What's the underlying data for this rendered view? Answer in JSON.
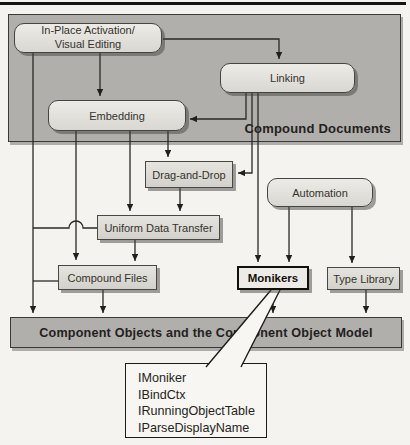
{
  "figure": {
    "regions": {
      "compound_documents": {
        "label": "Compound Documents"
      },
      "com_bar": {
        "label": "Component Objects and the Component Object Model"
      }
    },
    "boxes": {
      "in_place": {
        "line1": "In-Place Activation/",
        "line2": "Visual Editing"
      },
      "linking": {
        "label": "Linking"
      },
      "embedding": {
        "label": "Embedding"
      },
      "drag_and_drop": {
        "label": "Drag-and-Drop"
      },
      "automation": {
        "label": "Automation"
      },
      "uniform_data_transfer": {
        "label": "Uniform Data Transfer"
      },
      "compound_files": {
        "label": "Compound Files"
      },
      "monikers": {
        "label": "Monikers"
      },
      "type_library": {
        "label": "Type Library"
      }
    },
    "callout": {
      "interfaces": [
        "IMoniker",
        "IBindCtx",
        "IRunningObjectTable",
        "IParseDisplayName"
      ]
    },
    "colors": {
      "region_fill": "#b1afab",
      "box_fill_light": "#edebe6",
      "box_border": "#47443f",
      "line": "#2b2927",
      "paper": "#f4f3f0",
      "callout_fill": "#f7f6f3"
    }
  }
}
